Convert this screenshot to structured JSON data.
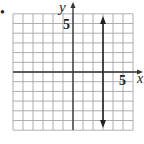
{
  "bullet": "•",
  "axes": {
    "x_label": "x",
    "y_label": "y",
    "x_tick_label": "5",
    "y_tick_label": "5"
  },
  "chart_data": {
    "type": "line",
    "title": "",
    "xlabel": "x",
    "ylabel": "y",
    "xlim": [
      -6,
      6
    ],
    "ylim": [
      -6,
      6
    ],
    "grid": true,
    "grid_step": 1,
    "tick_labels": {
      "x": [
        "5"
      ],
      "y": [
        "5"
      ]
    },
    "series": [
      {
        "name": "x = 3",
        "equation": "x = 3",
        "type": "vertical-line",
        "x": [
          3,
          3
        ],
        "y": [
          -5.5,
          5.5
        ],
        "arrows": "both"
      }
    ]
  }
}
